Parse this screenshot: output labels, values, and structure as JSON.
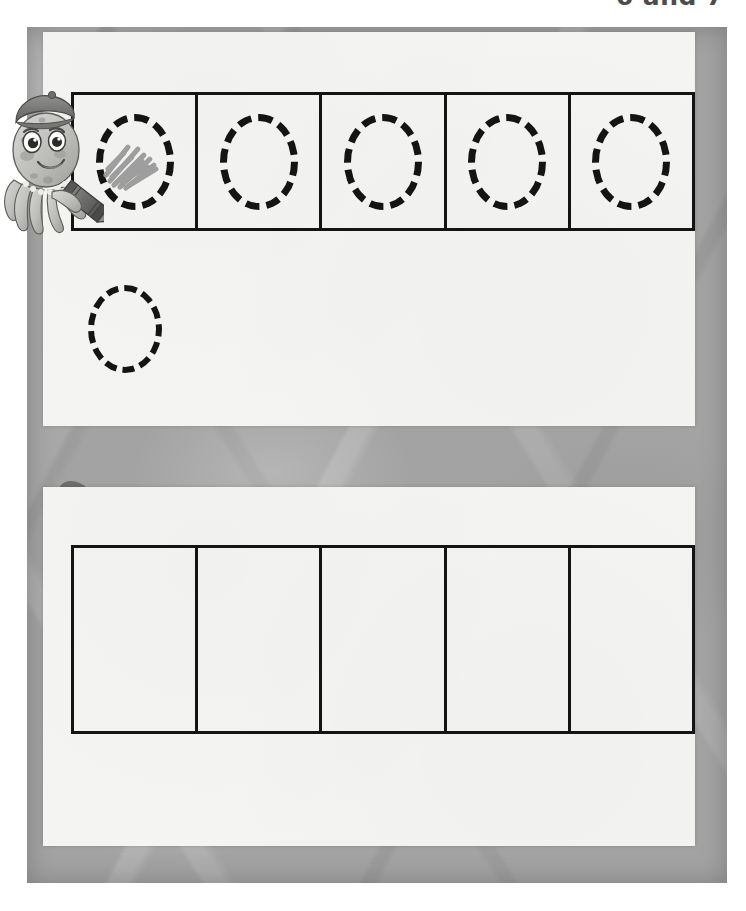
{
  "page": {
    "header_title": "6 and 7",
    "background_color": "#ffffff",
    "frame_color": "#a3a3a3",
    "panel_color": "#f4f4f2",
    "ink_color": "#141414",
    "badge_color": "#6e6e6e",
    "scribble_color": "#9a9a9a"
  },
  "mascot": {
    "name": "octopus-with-crayon",
    "hat": "beret",
    "accessory": "pearl-necklace",
    "holding": "crayon"
  },
  "exercises": [
    {
      "number": "1",
      "badge_shape": "star",
      "grid": {
        "columns": 5,
        "cells": [
          {
            "index": 1,
            "shape": "dashed-circle",
            "filled": true,
            "fill_style": "crayon-scribble"
          },
          {
            "index": 2,
            "shape": "dashed-circle",
            "filled": false,
            "fill_style": ""
          },
          {
            "index": 3,
            "shape": "dashed-circle",
            "filled": false,
            "fill_style": ""
          },
          {
            "index": 4,
            "shape": "dashed-circle",
            "filled": false,
            "fill_style": ""
          },
          {
            "index": 5,
            "shape": "dashed-circle",
            "filled": false,
            "fill_style": ""
          }
        ]
      },
      "practice_area": {
        "shapes": [
          {
            "index": 1,
            "shape": "dashed-circle",
            "filled": false
          }
        ]
      }
    },
    {
      "number": "2",
      "badge_shape": "blob",
      "grid": {
        "columns": 5,
        "cells": [
          {
            "index": 1,
            "shape": "empty",
            "filled": false,
            "fill_style": ""
          },
          {
            "index": 2,
            "shape": "empty",
            "filled": false,
            "fill_style": ""
          },
          {
            "index": 3,
            "shape": "empty",
            "filled": false,
            "fill_style": ""
          },
          {
            "index": 4,
            "shape": "empty",
            "filled": false,
            "fill_style": ""
          },
          {
            "index": 5,
            "shape": "empty",
            "filled": false,
            "fill_style": ""
          }
        ]
      },
      "practice_area": {
        "shapes": []
      }
    }
  ]
}
